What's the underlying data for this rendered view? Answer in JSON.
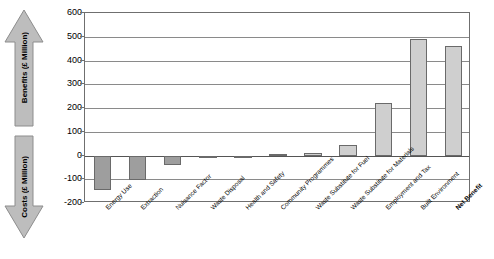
{
  "axes": {
    "left_arrow_up_label": "Benefits (£ Million)",
    "left_arrow_down_label": "Costs (£ Million)",
    "y_ticks": [
      "600",
      "500",
      "400",
      "300",
      "200",
      "100",
      "0",
      "-100",
      "-200"
    ]
  },
  "chart_data": {
    "type": "bar",
    "title": "",
    "xlabel": "",
    "ylabel": "Benefits / Costs (£ Million)",
    "ylim": [
      -200,
      600
    ],
    "ytick_step": 100,
    "grid": true,
    "legend": false,
    "categories": [
      "Energy Use",
      "Extraction",
      "Nuisance Factor",
      "Waste Disposal",
      "Health and Safety",
      "Community Programmes",
      "Waste Substitute for Fuel",
      "Waste Substitute for Materials",
      "Employment and Tax",
      "Built Environment",
      "Net Benefit"
    ],
    "values": [
      -145,
      -105,
      -40,
      -10,
      -8,
      8,
      10,
      45,
      220,
      490,
      460
    ],
    "emphasis_category": "Net Benefit",
    "colors": {
      "negative_bar": "#9e9e9e",
      "positive_bar": "#cfcfcf",
      "bar_border": "#6a6a6a",
      "gridline": "#8a8a8a",
      "frame": "#6f6f6f",
      "arrow_fill": "#bdbdbd"
    }
  }
}
